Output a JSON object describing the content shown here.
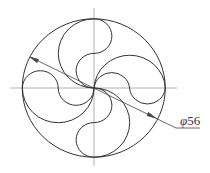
{
  "drawing": {
    "type": "pinwheel-circle-construction",
    "outer_circle": {
      "cx": 93.5,
      "cy": 88,
      "rx": 71.5,
      "ry": 69
    },
    "petal_count": 4,
    "colors": {
      "outline": "#333333",
      "centerline": "#9a9a9a",
      "dimension": "#444444"
    }
  },
  "dimension": {
    "symbol": "φ",
    "value": "56",
    "label": "φ56"
  }
}
